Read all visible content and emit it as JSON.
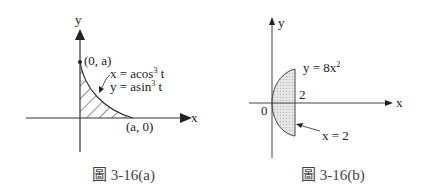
{
  "figures": [
    {
      "id": "a",
      "caption": "圖 3-16(a)",
      "axes": {
        "x_label": "x",
        "y_label": "y"
      },
      "points": [
        {
          "label": "(0, a)"
        },
        {
          "label": "(a, 0)"
        }
      ],
      "curve": {
        "equation_x_prefix": "x = acos",
        "equation_x_exp": "3",
        "equation_x_suffix": " t",
        "equation_y_prefix": "y = asin",
        "equation_y_exp": "3",
        "equation_y_suffix": " t"
      },
      "region": "hatched area under astroid in first quadrant"
    },
    {
      "id": "b",
      "caption": "圖 3-16(b)",
      "axes": {
        "x_label": "x",
        "y_label": "y"
      },
      "origin_label": "0",
      "tick_label": "2",
      "curve": {
        "equation_prefix": "y = 8x",
        "equation_exp": "2"
      },
      "line": {
        "equation": "x = 2"
      },
      "region": "shaded region between y² = 8x and x = 2"
    }
  ]
}
